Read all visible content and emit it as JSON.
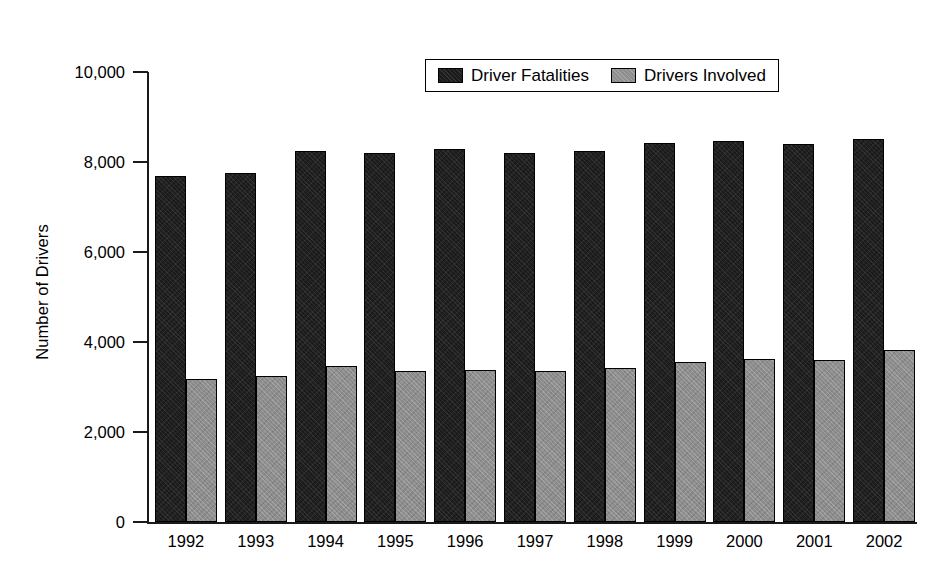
{
  "chart_data": {
    "type": "bar",
    "title": "",
    "xlabel": "",
    "ylabel": "Number of Drivers",
    "ylim": [
      0,
      10000
    ],
    "yticks": [
      "0",
      "2,000",
      "4,000",
      "6,000",
      "8,000",
      "10,000"
    ],
    "ytick_values": [
      0,
      2000,
      4000,
      6000,
      8000,
      10000
    ],
    "grid": false,
    "legend_position": "top-center",
    "categories": [
      "1992",
      "1993",
      "1994",
      "1995",
      "1996",
      "1997",
      "1998",
      "1999",
      "2000",
      "2001",
      "2002"
    ],
    "series": [
      {
        "name": "Driver Fatalities",
        "color": "#1b1b1b",
        "values": [
          7680,
          7750,
          8240,
          8210,
          8300,
          8190,
          8240,
          8430,
          8460,
          8400,
          8510
        ]
      },
      {
        "name": "Drivers Involved",
        "color": "#8d8d8d",
        "values": [
          3170,
          3240,
          3460,
          3360,
          3380,
          3350,
          3420,
          3560,
          3620,
          3600,
          3820
        ]
      }
    ]
  }
}
